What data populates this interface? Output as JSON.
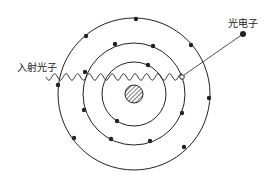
{
  "diagram": {
    "labels": {
      "incident_photon": "入射光子",
      "photoelectron": "光电子"
    },
    "colors": {
      "line": "#222222",
      "background": "#ffffff"
    },
    "nucleus": {
      "cx": 134,
      "cy": 94,
      "r": 9
    },
    "orbits": [
      {
        "name": "inner",
        "r": 32
      },
      {
        "name": "middle",
        "r": 51
      },
      {
        "name": "outer",
        "r": 76
      }
    ],
    "electrons": [
      [
        136,
        19
      ],
      [
        86,
        36
      ],
      [
        191,
        45
      ],
      [
        209,
        98
      ],
      [
        58,
        85
      ],
      [
        74,
        138
      ],
      [
        184,
        147
      ],
      [
        115,
        44
      ],
      [
        153,
        46
      ],
      [
        85,
        72
      ],
      [
        84,
        110
      ],
      [
        182,
        113
      ],
      [
        111,
        139
      ],
      [
        150,
        141
      ],
      [
        148,
        65
      ],
      [
        117,
        121
      ]
    ],
    "vacancy": [
      182,
      77
    ],
    "photoelectron": [
      243,
      34
    ]
  }
}
